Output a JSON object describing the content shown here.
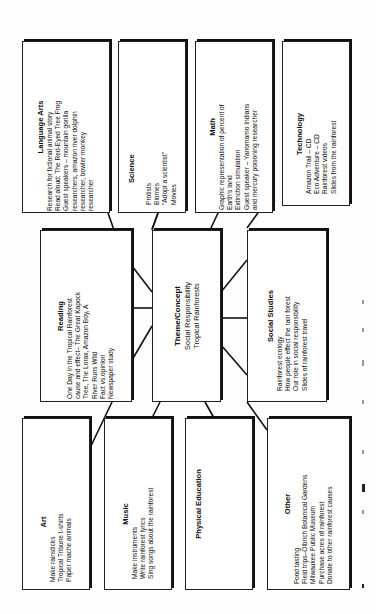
{
  "diagram": {
    "center": {
      "title": "Theme/Concept",
      "lines": [
        "Social Responsibility",
        "Tropical Rainforests"
      ]
    },
    "boxes": {
      "language_arts": {
        "title": "Language Arts",
        "lines": [
          "Research for fictional animal story",
          "Read aloud: The Red-Eyed Tree Frog",
          "Guest speakers – mountain gorilla",
          "researchers, amazon river dolphin",
          "researcher, bowler monkey",
          "researcher"
        ]
      },
      "science": {
        "title": "Science",
        "lines": [
          "Protists",
          "Biomes",
          "\"Adopt a scientist\"",
          "Movies"
        ]
      },
      "math": {
        "title": "Math",
        "lines": [
          "Graphic representation of percent of",
          "Earth's land",
          "Extinction simulation",
          "Guest speaker – Yanomamo Indians",
          "and mercury poisoning researcher"
        ]
      },
      "technology": {
        "title": "Technology",
        "lines": [
          "Amazon Trail – CD",
          "Eco Adventure – CD",
          "Rainforest videos",
          "Slides from the rainforest"
        ]
      },
      "reading": {
        "title": "Reading",
        "lines": [
          "One Day in the Tropical Rainforest",
          "cause and effect– The Great Kapock",
          "Tree, The Lorax, Amazon Boy, A",
          "River Runs Wild",
          "Fact vs.opinion",
          "Newspaper study"
        ]
      },
      "social_studies": {
        "title": "Social Studies",
        "lines": [
          "Rainforest ecology",
          "How people effect the rain forest",
          "Our role in social responsibility",
          "Slides of rainforest travel"
        ]
      },
      "art": {
        "title": "Art",
        "lines": [
          "Make rainsticks",
          "Tropical Tribune t-shirts",
          "Paper mache animals"
        ]
      },
      "music": {
        "title": "Music",
        "lines": [
          "Make instruments",
          "Write rainforest lyrics",
          "Sing songs about the rainforest"
        ]
      },
      "physical_education": {
        "title": "Physical Education",
        "lines": []
      },
      "other": {
        "title": "Other",
        "lines": [
          "Food tasting",
          "Field trips–Olbrich Botanical Gardens",
          "Milwaukee Public Museum",
          "Purchase acres of rainforest",
          "Donate to other rainforest causes"
        ]
      }
    },
    "colors": {
      "border": "#222222",
      "background": "#ffffff",
      "text": "#111111"
    }
  }
}
